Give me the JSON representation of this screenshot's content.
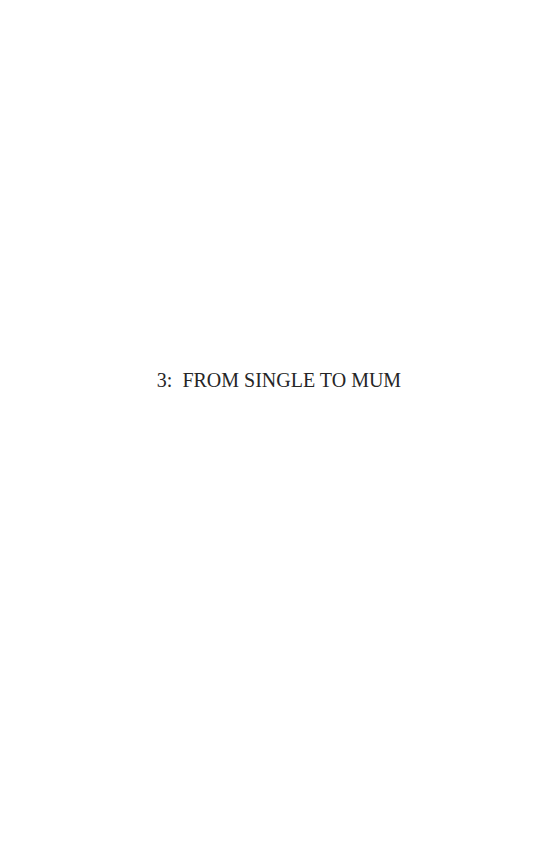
{
  "page": {
    "chapter_heading": "3:  FROM SINGLE TO MUM"
  }
}
